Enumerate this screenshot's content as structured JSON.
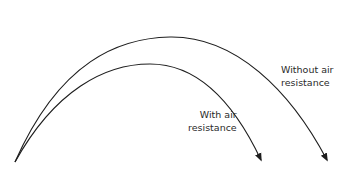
{
  "diagram": {
    "type": "projectile-trajectories",
    "stroke_color": "#1e1e1e",
    "background": "#ffffff",
    "trajectories": [
      {
        "id": "without-air-resistance",
        "label_lines": [
          "Without air",
          "resistance"
        ],
        "start": [
          15,
          162
        ],
        "peak": [
          170,
          37
        ],
        "end": [
          327,
          160
        ]
      },
      {
        "id": "with-air-resistance",
        "label_lines": [
          "With air",
          "resistance"
        ],
        "start": [
          15,
          162
        ],
        "peak": [
          158,
          64
        ],
        "end": [
          261,
          160
        ]
      }
    ]
  },
  "labels": {
    "without": {
      "line1": "Without air",
      "line2": "resistance"
    },
    "with": {
      "line1": "With air",
      "line2": "resistance"
    }
  }
}
